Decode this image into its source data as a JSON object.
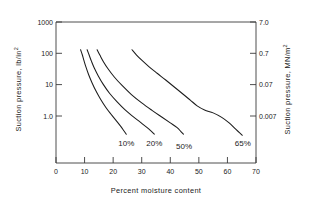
{
  "chart_data": {
    "type": "line",
    "title": "",
    "xlabel": "Percent moisture content",
    "ylabel_left": "Suction pressure,  lb/in",
    "ylabel_left_sup": "2",
    "ylabel_right": "Suction pressure,  MN/m",
    "ylabel_right_sup": "2",
    "xlim": [
      0,
      70
    ],
    "ylim_left": [
      0.2,
      1000
    ],
    "ylim_right": [
      0.0014,
      7.0
    ],
    "yscale": "log",
    "xscale": "linear",
    "grid": false,
    "legend": "none",
    "xticks": [
      "0",
      "10",
      "20",
      "30",
      "40",
      "50",
      "60",
      "70"
    ],
    "xtick_values": [
      0,
      10,
      20,
      30,
      40,
      50,
      60,
      70
    ],
    "yticks_left": [
      "1000",
      "100",
      "10",
      "1.0"
    ],
    "ytick_values_left": [
      1000,
      100,
      10,
      1.0
    ],
    "yticks_right": [
      "7.0",
      "0.7",
      "0.07",
      "0.007"
    ],
    "ytick_values_right": [
      7.0,
      0.7,
      0.07,
      0.007
    ],
    "series": [
      {
        "name": "10%",
        "label": "10%",
        "annotation": "10%",
        "points": [
          [
            8.6,
            130
          ],
          [
            9.2,
            90
          ],
          [
            9.8,
            58
          ],
          [
            10.5,
            36
          ],
          [
            11.4,
            21
          ],
          [
            12.6,
            11.5
          ],
          [
            14.0,
            6.2
          ],
          [
            15.6,
            3.4
          ],
          [
            17.4,
            1.9
          ],
          [
            19.2,
            1.15
          ],
          [
            21.0,
            0.72
          ],
          [
            22.6,
            0.47
          ],
          [
            23.8,
            0.33
          ],
          [
            24.6,
            0.26
          ]
        ]
      },
      {
        "name": "20%",
        "label": "20%",
        "annotation": "20%",
        "points": [
          [
            10.9,
            130
          ],
          [
            11.6,
            88
          ],
          [
            12.4,
            56
          ],
          [
            13.4,
            34
          ],
          [
            14.8,
            19
          ],
          [
            16.6,
            10.0
          ],
          [
            18.8,
            5.2
          ],
          [
            21.4,
            2.8
          ],
          [
            24.2,
            1.55
          ],
          [
            27.0,
            0.95
          ],
          [
            29.6,
            0.62
          ],
          [
            31.8,
            0.43
          ],
          [
            33.4,
            0.32
          ],
          [
            34.4,
            0.26
          ]
        ]
      },
      {
        "name": "50%",
        "label": "50%",
        "annotation": "50%",
        "points": [
          [
            14.4,
            130
          ],
          [
            15.4,
            86
          ],
          [
            16.6,
            54
          ],
          [
            18.2,
            32
          ],
          [
            20.4,
            17.5
          ],
          [
            23.2,
            9.2
          ],
          [
            26.4,
            4.8
          ],
          [
            30.0,
            2.6
          ],
          [
            33.6,
            1.5
          ],
          [
            37.0,
            0.92
          ],
          [
            40.0,
            0.6
          ],
          [
            42.4,
            0.42
          ],
          [
            43.8,
            0.31
          ],
          [
            44.6,
            0.26
          ]
        ]
      },
      {
        "name": "65%",
        "label": "65%",
        "annotation": "65%",
        "points": [
          [
            26.6,
            130
          ],
          [
            28.2,
            88
          ],
          [
            30.2,
            58
          ],
          [
            32.6,
            37
          ],
          [
            35.4,
            23
          ],
          [
            38.4,
            14.0
          ],
          [
            41.4,
            8.4
          ],
          [
            44.4,
            5.0
          ],
          [
            47.0,
            3.2
          ],
          [
            49.4,
            2.1
          ],
          [
            52.0,
            1.55
          ],
          [
            55.0,
            1.25
          ],
          [
            58.0,
            0.9
          ],
          [
            60.6,
            0.6
          ],
          [
            62.6,
            0.4
          ],
          [
            64.2,
            0.29
          ],
          [
            65.2,
            0.24
          ]
        ]
      }
    ],
    "annotations": [
      {
        "text": "10%",
        "x": 24.6,
        "y_px": 146
      },
      {
        "text": "20%",
        "x": 34.4,
        "y_px": 146
      },
      {
        "text": "50%",
        "x": 44.8,
        "y_px": 149
      },
      {
        "text": "65%",
        "x": 65.4,
        "y_px": 146
      }
    ]
  }
}
